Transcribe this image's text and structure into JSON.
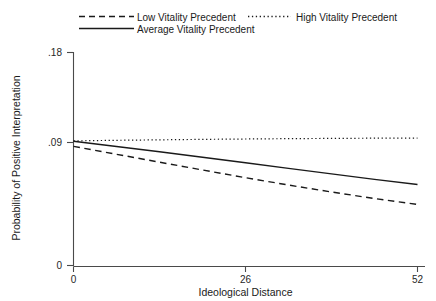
{
  "chart_data": {
    "type": "line",
    "title": "",
    "subtitle": "",
    "xlabel": "Ideological Distance",
    "ylabel": "Probability of Positive Interpretation",
    "xlim": [
      0,
      52
    ],
    "ylim": [
      0,
      0.18
    ],
    "xticks": [
      0,
      26,
      52
    ],
    "xticklabels": [
      "0",
      "26",
      "52"
    ],
    "yticks": [
      0,
      0.09,
      0.18
    ],
    "yticklabels": [
      "0",
      ".09",
      ".18"
    ],
    "grid": false,
    "legend_position": "top",
    "series": [
      {
        "name": "Low Vitality Precedent",
        "style": "dashed",
        "color": "#1a1a1a",
        "x": [
          0,
          6.5,
          13,
          19.5,
          26,
          32.5,
          39,
          45.5,
          52
        ],
        "values": [
          0.1007,
          0.094,
          0.0873,
          0.0807,
          0.0742,
          0.068,
          0.0621,
          0.0566,
          0.0516
        ]
      },
      {
        "name": "Average Vitality Precedent",
        "style": "solid",
        "color": "#1a1a1a",
        "x": [
          0,
          6.5,
          13,
          19.5,
          26,
          32.5,
          39,
          45.5,
          52
        ],
        "values": [
          0.105,
          0.1006,
          0.0961,
          0.0915,
          0.0868,
          0.0821,
          0.0774,
          0.0728,
          0.0684
        ]
      },
      {
        "name": "High Vitality Precedent",
        "style": "dotted",
        "color": "#1a1a1a",
        "x": [
          0,
          6.5,
          13,
          19.5,
          26,
          32.5,
          39,
          45.5,
          52
        ],
        "values": [
          0.1053,
          0.1058,
          0.1062,
          0.1066,
          0.1069,
          0.1072,
          0.1074,
          0.1076,
          0.1077
        ]
      }
    ]
  },
  "legend": {
    "items": [
      {
        "label": "Low Vitality Precedent",
        "style": "dashed"
      },
      {
        "label": "High Vitality Precedent",
        "style": "dotted"
      },
      {
        "label": "Average Vitality Precedent",
        "style": "solid"
      }
    ]
  },
  "axes": {
    "x_title": "Ideological Distance",
    "y_title": "Probability of Positive Interpretation",
    "x_tick_0": "0",
    "x_tick_1": "26",
    "x_tick_2": "52",
    "y_tick_0": "0",
    "y_tick_1": ".09",
    "y_tick_2": ".18"
  },
  "colors": {
    "line": "#1a1a1a",
    "axis": "#4a4a4a",
    "background": "#ffffff"
  }
}
